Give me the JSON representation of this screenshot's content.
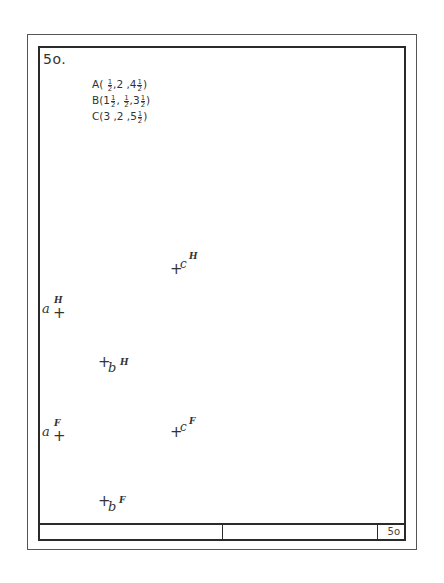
{
  "sheet": {
    "number_label": "5o.",
    "title_block_number": "5o"
  },
  "given_points": [
    {
      "label": "A",
      "text": "A(",
      "x": "1/2",
      "y": "2",
      "z": "4 1/2"
    },
    {
      "label": "B",
      "text": "B(",
      "x": "1 1/2",
      "y": "1/2",
      "z": "3 1/2"
    },
    {
      "label": "C",
      "text": "C(",
      "x": "3",
      "y": "2",
      "z": "5 1/2"
    }
  ],
  "coord_lines": [
    "A( ½,2 ,4½)",
    "B(1½, ½,3½)",
    "C(3 ,2 ,5½)"
  ],
  "projections": {
    "horizontal_view": [
      {
        "point": "a",
        "view": "H",
        "plus": "+",
        "letter": "a",
        "sup": "H"
      },
      {
        "point": "b",
        "view": "H",
        "plus": "+",
        "letter": "b",
        "sup": "H"
      },
      {
        "point": "c",
        "view": "H",
        "plus": "+",
        "letter": "c",
        "sup": "H"
      }
    ],
    "frontal_view": [
      {
        "point": "a",
        "view": "F",
        "plus": "+",
        "letter": "a",
        "sup": "F"
      },
      {
        "point": "b",
        "view": "F",
        "plus": "+",
        "letter": "b",
        "sup": "F"
      },
      {
        "point": "c",
        "view": "F",
        "plus": "+",
        "letter": "c",
        "sup": "F"
      }
    ]
  }
}
